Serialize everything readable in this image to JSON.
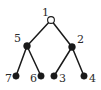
{
  "figure": {
    "kind": "binary-tree-diagram",
    "width": 101,
    "height": 90,
    "background_color": "#ffffff",
    "stroke_color": "#1a1a1a",
    "node_fill_color": "#1a1a1a",
    "root_fill_color": "#ffffff",
    "label_color": "#2b2b2b"
  },
  "nodes": [
    {
      "id": "n1",
      "label": "1",
      "x": 51,
      "y": 20,
      "r": 3.4,
      "filled": false,
      "label_x": 42,
      "label_y": 7,
      "role": "root"
    },
    {
      "id": "n5",
      "label": "5",
      "x": 27,
      "y": 46,
      "r": 3.4,
      "filled": true,
      "label_x": 14,
      "label_y": 33,
      "role": "internal"
    },
    {
      "id": "n2",
      "label": "2",
      "x": 72,
      "y": 47,
      "r": 3.4,
      "filled": true,
      "label_x": 77,
      "label_y": 34,
      "role": "internal"
    },
    {
      "id": "n7",
      "label": "7",
      "x": 16,
      "y": 76,
      "r": 3.2,
      "filled": true,
      "label_x": 5,
      "label_y": 73,
      "role": "leaf"
    },
    {
      "id": "n6",
      "label": "6",
      "x": 41,
      "y": 76,
      "r": 3.2,
      "filled": true,
      "label_x": 30,
      "label_y": 73,
      "role": "leaf"
    },
    {
      "id": "n3",
      "label": "3",
      "x": 54,
      "y": 76,
      "r": 3.2,
      "filled": true,
      "label_x": 59,
      "label_y": 73,
      "role": "leaf"
    },
    {
      "id": "n4",
      "label": "4",
      "x": 84,
      "y": 76,
      "r": 3.2,
      "filled": true,
      "label_x": 89,
      "label_y": 73,
      "role": "leaf"
    }
  ],
  "edges": [
    {
      "id": "e1",
      "from": "n1",
      "to": "n5",
      "x1": 51,
      "y1": 20,
      "x2": 27,
      "y2": 46
    },
    {
      "id": "e2",
      "from": "n1",
      "to": "n2",
      "x1": 51,
      "y1": 20,
      "x2": 72,
      "y2": 47
    },
    {
      "id": "e3",
      "from": "n5",
      "to": "n7",
      "x1": 27,
      "y1": 46,
      "x2": 16,
      "y2": 76
    },
    {
      "id": "e4",
      "from": "n5",
      "to": "n6",
      "x1": 27,
      "y1": 46,
      "x2": 41,
      "y2": 76
    },
    {
      "id": "e5",
      "from": "n2",
      "to": "n3",
      "x1": 72,
      "y1": 47,
      "x2": 54,
      "y2": 76
    },
    {
      "id": "e6",
      "from": "n2",
      "to": "n4",
      "x1": 72,
      "y1": 47,
      "x2": 84,
      "y2": 76
    }
  ]
}
